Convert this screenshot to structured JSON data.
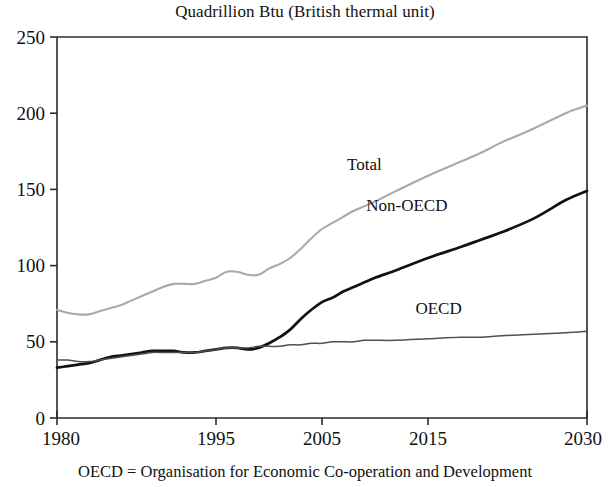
{
  "chart_data": {
    "type": "line",
    "title": "Quadrillion Btu (British thermal unit)",
    "subtitle": "",
    "xlabel": "",
    "ylabel": "",
    "footnote": "OECD = Organisation for Economic Co-operation and Development",
    "xlim": [
      1980,
      2030
    ],
    "ylim": [
      0,
      250
    ],
    "grid": false,
    "legend_position": "inline-annotations",
    "xticks": [
      1980,
      1995,
      2005,
      2015,
      2030
    ],
    "xtick_labels": [
      "1980",
      "1995",
      "2005",
      "2015",
      "2030"
    ],
    "yticks": [
      0,
      50,
      100,
      150,
      200,
      250
    ],
    "ytick_labels": [
      "0",
      "50",
      "100",
      "150",
      "200",
      "250"
    ],
    "x": [
      1980,
      1981,
      1982,
      1983,
      1984,
      1985,
      1986,
      1987,
      1988,
      1989,
      1990,
      1991,
      1992,
      1993,
      1994,
      1995,
      1996,
      1997,
      1998,
      1999,
      2000,
      2001,
      2002,
      2003,
      2004,
      2005,
      2006,
      2007,
      2008,
      2009,
      2010,
      2012,
      2015,
      2018,
      2020,
      2022,
      2025,
      2028,
      2030
    ],
    "series": [
      {
        "name": "Total",
        "color": "#a9a9a9",
        "label_x": 2009,
        "label_y": 163,
        "values": [
          71,
          69,
          68,
          68,
          70,
          72,
          74,
          77,
          80,
          83,
          86,
          88,
          88,
          88,
          90,
          92,
          96,
          96,
          94,
          94,
          98,
          101,
          105,
          111,
          118,
          124,
          128,
          132,
          136,
          139,
          142,
          149,
          159,
          168,
          174,
          181,
          190,
          200,
          205
        ]
      },
      {
        "name": "Non-OECD",
        "color": "#111111",
        "label_x": 2013,
        "label_y": 136,
        "values": [
          33,
          34,
          35,
          36,
          38,
          40,
          41,
          42,
          43,
          44,
          44,
          44,
          43,
          43,
          44,
          45,
          46,
          46,
          45,
          46,
          49,
          53,
          58,
          65,
          71,
          76,
          79,
          83,
          86,
          89,
          92,
          97,
          105,
          112,
          117,
          122,
          131,
          143,
          149
        ]
      },
      {
        "name": "OECD",
        "color": "#4f4f4f",
        "label_x": 2016,
        "label_y": 68,
        "values": [
          38,
          38,
          37,
          37,
          38,
          39,
          40,
          41,
          42,
          43,
          43,
          43,
          43,
          43,
          44,
          45,
          46,
          46,
          46,
          47,
          47,
          47,
          48,
          48,
          49,
          49,
          50,
          50,
          50,
          51,
          51,
          51,
          52,
          53,
          53,
          54,
          55,
          56,
          57
        ]
      }
    ]
  }
}
